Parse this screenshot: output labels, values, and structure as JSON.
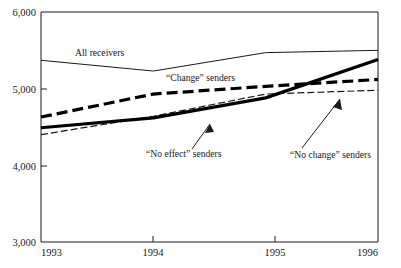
{
  "chart_data": {
    "type": "line",
    "title": "",
    "subtitle": "",
    "xlabel": "",
    "ylabel": "",
    "x": [
      1993,
      1994,
      1995,
      1996
    ],
    "xtick_labels": [
      "1993",
      "1994",
      "1995",
      "1996"
    ],
    "ytick_labels": [
      "3,000",
      "4,000",
      "5,000",
      "6,000"
    ],
    "yticks": [
      3000,
      4000,
      5000,
      6000
    ],
    "xlim": [
      1993,
      1996
    ],
    "ylim": [
      3000,
      6000
    ],
    "grid": false,
    "legend": "none",
    "annotations_position": "inline-labels-with-leader-lines",
    "series": [
      {
        "name": "All receivers",
        "style": "thin-solid",
        "color": "#1a1a1a",
        "values": [
          5370,
          5230,
          5470,
          5500
        ]
      },
      {
        "name": "“Change” senders",
        "style": "thick-dashed",
        "color": "#000000",
        "values": [
          4630,
          4930,
          5030,
          5120
        ]
      },
      {
        "name": "“No effect” senders",
        "style": "thick-solid",
        "color": "#000000",
        "values": [
          4490,
          4620,
          4880,
          5380
        ]
      },
      {
        "name": "“No change” senders",
        "style": "thin-dashed",
        "color": "#1a1a1a",
        "values": [
          4400,
          4640,
          4930,
          4980
        ]
      }
    ]
  },
  "annotations": {
    "all_receivers": {
      "label": "All receivers",
      "x": 75,
      "y": 56,
      "leader": false
    },
    "change_senders": {
      "label": "“Change” senders",
      "x": 166,
      "y": 81,
      "leader": false
    },
    "no_effect_senders": {
      "label": "“No effect” senders",
      "x": 146,
      "y": 157,
      "leader": true
    },
    "no_change_senders": {
      "label": "“No change” senders",
      "x": 290,
      "y": 158,
      "leader": true
    }
  },
  "axis": {
    "y_top_label": "6,000",
    "y_bottom_label": "3,000",
    "x_left_label": "1993",
    "x_right_label": "1996"
  }
}
